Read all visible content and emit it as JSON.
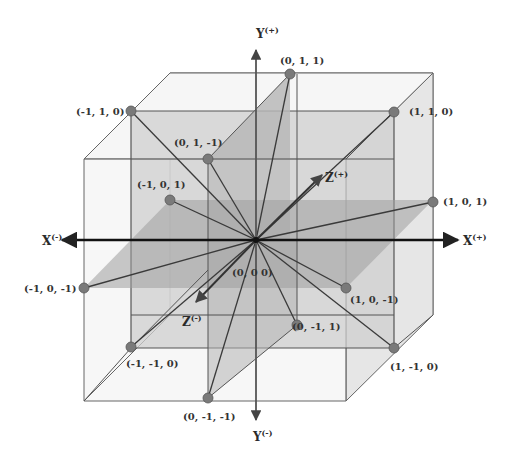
{
  "diagram": {
    "title": "",
    "colors": {
      "background": "#ffffff",
      "outer_cube_face": "#ececec",
      "inner_cube_face": "#c8c8c8",
      "plane_xz": "#a8a8a8",
      "edge": "#555555",
      "axis": "#111111",
      "vector": "#444444",
      "point": "#777777"
    },
    "axes": {
      "x_pos": {
        "label": "X",
        "sup": "(+)"
      },
      "x_neg": {
        "label": "X",
        "sup": "(-)"
      },
      "y_pos": {
        "label": "Y",
        "sup": "(+)"
      },
      "y_neg": {
        "label": "Y",
        "sup": "(-)"
      },
      "z_pos": {
        "label": "Z",
        "sup": "(+)"
      },
      "z_neg": {
        "label": "Z",
        "sup": "(-)"
      }
    },
    "origin_label": "(0, 0  0)",
    "points": [
      {
        "id": "p_0_1_1",
        "label": "(0, 1, 1)"
      },
      {
        "id": "p_m1_1_0",
        "label": "(-1, 1, 0)"
      },
      {
        "id": "p_1_1_0",
        "label": "(1, 1, 0)"
      },
      {
        "id": "p_0_1_m1",
        "label": "(0, 1, -1)"
      },
      {
        "id": "p_m1_0_1",
        "label": "(-1, 0, 1)"
      },
      {
        "id": "p_1_0_1",
        "label": "(1, 0, 1)"
      },
      {
        "id": "p_m1_0_m1",
        "label": "(-1, 0, -1)"
      },
      {
        "id": "p_1_0_m1",
        "label": "(1, 0, -1)"
      },
      {
        "id": "p_0_m1_1",
        "label": "(0, -1, 1)"
      },
      {
        "id": "p_m1_m1_0",
        "label": "(-1, -1, 0)"
      },
      {
        "id": "p_1_m1_0",
        "label": "(1, -1, 0)"
      },
      {
        "id": "p_0_m1_m1",
        "label": "(0, -1, -1)"
      }
    ]
  }
}
